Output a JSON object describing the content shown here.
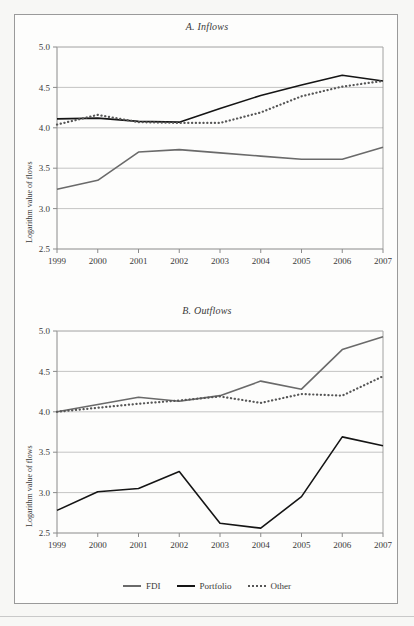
{
  "figure": {
    "ylabel": "Logarithm value of flows",
    "y_ticks": [
      "5.0",
      "4.5",
      "4.0",
      "3.5",
      "3.0",
      "2.5"
    ],
    "x_ticks": [
      "1999",
      "2000",
      "2001",
      "2002",
      "2003",
      "2004",
      "2005",
      "2006",
      "2007"
    ],
    "panel_a_title": "A. Inflows",
    "panel_b_title": "B. Outflows"
  },
  "legend": {
    "position": "bottom-center",
    "items": [
      {
        "label": "FDI",
        "style": "solid",
        "color": "#6a6a6a"
      },
      {
        "label": "Portfolio",
        "style": "solid",
        "color": "#151515"
      },
      {
        "label": "Other",
        "style": "dotted",
        "color": "#565656"
      }
    ]
  },
  "colors": {
    "fdi": "#6a6a6a",
    "portfolio": "#151515",
    "other": "#565656",
    "grid": "#b5b5b5",
    "axis": "#8a8a8a",
    "frame": "#9a9a9a",
    "page_bg": "#f7f7f5",
    "panel_bg": "#fdfdfc"
  },
  "chart_data": [
    {
      "type": "line",
      "title": "A. Inflows",
      "xlabel": "",
      "ylabel": "Logarithm value of flows",
      "x": [
        1999,
        2000,
        2001,
        2002,
        2003,
        2004,
        2005,
        2006,
        2007
      ],
      "categories": [
        "1999",
        "2000",
        "2001",
        "2002",
        "2003",
        "2004",
        "2005",
        "2006",
        "2007"
      ],
      "ylim": [
        2.5,
        5.0
      ],
      "y_ticks": [
        2.5,
        3.0,
        3.5,
        4.0,
        4.5,
        5.0
      ],
      "grid": true,
      "legend": "bottom",
      "series": [
        {
          "name": "FDI",
          "style": "solid",
          "color": "#6a6a6a",
          "values": [
            3.24,
            3.35,
            3.7,
            3.73,
            3.69,
            3.65,
            3.61,
            3.61,
            3.76
          ]
        },
        {
          "name": "Portfolio",
          "style": "solid",
          "color": "#151515",
          "values": [
            4.11,
            4.12,
            4.08,
            4.07,
            4.24,
            4.4,
            4.53,
            4.65,
            4.58
          ]
        },
        {
          "name": "Other",
          "style": "dotted",
          "color": "#565656",
          "values": [
            4.04,
            4.16,
            4.07,
            4.06,
            4.06,
            4.19,
            4.39,
            4.51,
            4.58
          ]
        }
      ]
    },
    {
      "type": "line",
      "title": "B. Outflows",
      "xlabel": "",
      "ylabel": "Logarithm value of flows",
      "x": [
        1999,
        2000,
        2001,
        2002,
        2003,
        2004,
        2005,
        2006,
        2007
      ],
      "categories": [
        "1999",
        "2000",
        "2001",
        "2002",
        "2003",
        "2004",
        "2005",
        "2006",
        "2007"
      ],
      "ylim": [
        2.5,
        5.0
      ],
      "y_ticks": [
        2.5,
        3.0,
        3.5,
        4.0,
        4.5,
        5.0
      ],
      "grid": true,
      "legend": "bottom",
      "series": [
        {
          "name": "FDI",
          "style": "solid",
          "color": "#6a6a6a",
          "values": [
            4.0,
            4.09,
            4.18,
            4.13,
            4.2,
            4.38,
            4.28,
            4.77,
            4.93
          ]
        },
        {
          "name": "Portfolio",
          "style": "solid",
          "color": "#151515",
          "values": [
            2.78,
            3.01,
            3.05,
            3.26,
            2.62,
            2.56,
            2.95,
            3.69,
            3.58
          ]
        },
        {
          "name": "Other",
          "style": "dotted",
          "color": "#565656",
          "values": [
            4.0,
            4.05,
            4.1,
            4.14,
            4.19,
            4.11,
            4.22,
            4.2,
            4.44
          ]
        }
      ]
    }
  ]
}
